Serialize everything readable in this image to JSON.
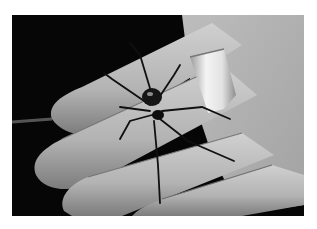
{
  "image": {
    "description": "Black and white photograph of a black widow-like spider resting on the fingers of an open hand wearing a wide metal ring",
    "subject": "spider",
    "palette": {
      "background": "#060606",
      "skin_light": "#c8c8c8",
      "skin_mid": "#9a9a9a",
      "skin_shadow": "#6a6a6a",
      "spider": "#111111",
      "ring": "#e8e8e8",
      "page": "#ffffff"
    }
  }
}
